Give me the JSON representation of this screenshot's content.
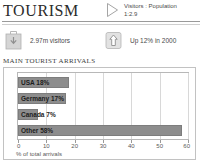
{
  "header": {
    "title": "TOURISM",
    "triangle_icon": "triangle-right-icon",
    "ratio_label": "Visitors : Population",
    "ratio_value": "1:2.9"
  },
  "stats": [
    {
      "icon": "suitcase-icon",
      "text": "2.97m visitors"
    },
    {
      "icon": "up-arrow-box-icon",
      "text": "Up 12% in 2000"
    }
  ],
  "chart_data": {
    "type": "bar",
    "orientation": "horizontal",
    "title": "MAIN TOURIST ARRIVALS",
    "xlabel": "% of total arrivals",
    "ylabel": "",
    "categories": [
      "USA",
      "Germany",
      "Canada",
      "Other"
    ],
    "values": [
      18,
      17,
      7,
      58
    ],
    "bar_labels": [
      "USA 18%",
      "Germany 17%",
      "Canada 7%",
      "Other 58%"
    ],
    "xlim": [
      0,
      60
    ],
    "xticks": [
      0,
      10,
      20,
      30,
      40,
      50,
      60
    ],
    "xtick_labels": [
      "0",
      "10",
      "20",
      "30",
      "40",
      "50",
      "60"
    ],
    "grid": true,
    "legend": false,
    "bar_color": "#8d8d8d",
    "bar_border_color": "#7d7d7d"
  },
  "colors": {
    "rule": "#9a9a9a",
    "panel_border": "#c2c2c2",
    "grid": "#d8d8d8",
    "text": "#4a4a4a"
  }
}
